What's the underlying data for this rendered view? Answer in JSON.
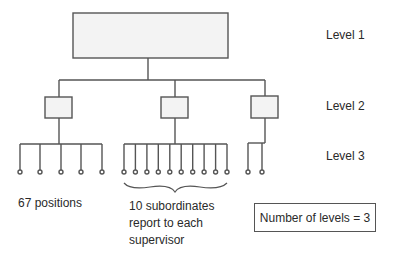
{
  "diagram": {
    "type": "organization-chart",
    "level_labels": [
      "Level 1",
      "Level 2",
      "Level 3"
    ],
    "annotations": {
      "positions": "67 positions",
      "span_line1": "10 subordinates",
      "span_line2": "report to each",
      "span_line3": "supervisor"
    },
    "summary_box": "Number of levels = 3",
    "structure": {
      "level1_nodes": 1,
      "level2_nodes": 3,
      "level3_children_shown": [
        5,
        10,
        2
      ]
    },
    "colors": {
      "line": "#555555",
      "box_fill": "#f4f4f4"
    }
  }
}
